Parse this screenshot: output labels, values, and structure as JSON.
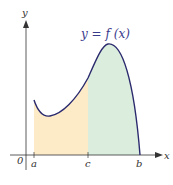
{
  "diagram": {
    "curve_label": "y = f (x)",
    "axis_labels": {
      "x": "x",
      "y": "y",
      "origin": "0"
    },
    "tick_labels": {
      "a": "a",
      "c": "c",
      "b": "b"
    },
    "colors": {
      "curve": "#2b2a6e",
      "region_left": "#fdebc8",
      "region_right": "#dbeedd",
      "axes": "#333333"
    }
  }
}
